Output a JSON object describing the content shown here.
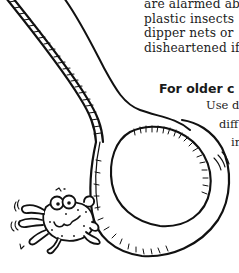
{
  "document": {
    "body_lines": [
      "are alarmed ab",
      "plastic insects",
      "dipper nets or",
      "disheartened if"
    ],
    "section": {
      "heading": "For older c",
      "lines": [
        "Use de",
        "diff",
        "ir"
      ]
    }
  },
  "illustration": {
    "subject": "spoon-with-crab",
    "elements": [
      "spoon-handle",
      "spoon-bowl",
      "crab"
    ],
    "line_color": "#111111",
    "background_color": "#ffffff"
  }
}
